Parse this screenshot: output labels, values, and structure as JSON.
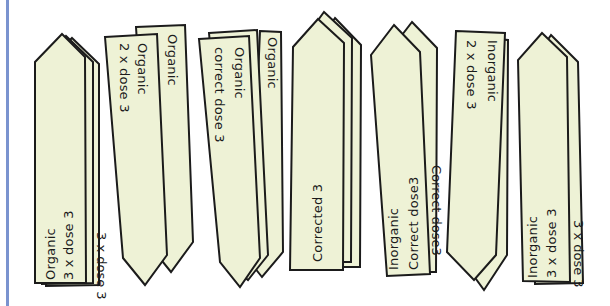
{
  "figure": {
    "colors": {
      "label_fill": "#eef2d6",
      "label_stroke": "#1b1b1b",
      "edge_line": "#7a93cf",
      "background": "#ffffff"
    },
    "groups": [
      {
        "id": "organic-3x",
        "front_line1": "Organic",
        "front_line2": "3 x dose 3",
        "back_partial": "3 x dose 3",
        "orientation": "point-up"
      },
      {
        "id": "organic-2x",
        "front_line1": "Organic",
        "front_line2": "2 x dose 3",
        "back_partial": "Organic",
        "orientation": "point-down"
      },
      {
        "id": "organic-correct",
        "front_line1": "Organic",
        "front_line2": "correct dose 3",
        "back_partial": "Organic",
        "orientation": "point-down"
      },
      {
        "id": "corrected",
        "front_line1": "Corrected 3",
        "orientation": "point-up"
      },
      {
        "id": "inorganic-correct",
        "front_line1": "Inorganic",
        "front_line2": "Correct dose3",
        "back_partial": "Correct dose3",
        "orientation": "point-up"
      },
      {
        "id": "inorganic-2x",
        "front_line1": "Inorganic",
        "front_line2": "2 x dose 3",
        "orientation": "point-down"
      },
      {
        "id": "inorganic-3x",
        "front_line1": "Inorganic",
        "front_line2": "3 x dose 3",
        "back_partial": "3 x dose 3",
        "orientation": "point-up"
      }
    ]
  }
}
